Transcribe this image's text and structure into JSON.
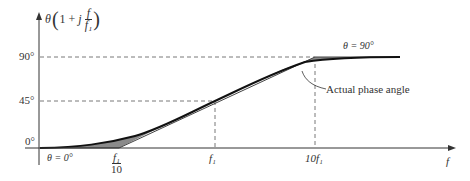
{
  "diagram": {
    "y_axis_label": {
      "theta": "θ",
      "open": "(1 + ",
      "j": "j",
      "num": "f",
      "den": "f₁",
      "close": ")"
    },
    "y_ticks": [
      "90°",
      "45°",
      "0°"
    ],
    "x_ticks": {
      "f1_over_10": {
        "num": "f₁",
        "den": "10"
      },
      "f1": "f₁",
      "ten_f1": "10f₁"
    },
    "x_axis_label": "f",
    "annotations": {
      "low": "θ = 0°",
      "high": "θ = 90°",
      "actual": "Actual phase angle"
    },
    "colors": {
      "line": "#222222",
      "shade": "#8a8a8a",
      "dash": "#555555"
    }
  }
}
